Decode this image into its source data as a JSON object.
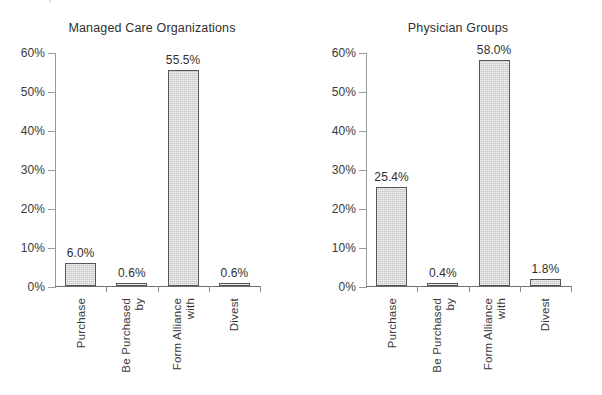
{
  "document": {
    "cropped_header_text": "What Hospitals Should Do in the Year Ahead"
  },
  "chart_data": [
    {
      "type": "bar",
      "title": "Managed Care Organizations",
      "categories": [
        "Purchase",
        "Be Purchased by",
        "Form Alliance with",
        "Divest"
      ],
      "category_lines": [
        [
          "Purchase"
        ],
        [
          "Be Purchased",
          "by"
        ],
        [
          "Form Alliance",
          "with"
        ],
        [
          "Divest"
        ]
      ],
      "values": [
        6.0,
        0.6,
        55.5,
        0.6
      ],
      "value_labels": [
        "6.0%",
        "0.6%",
        "55.5%",
        "0.6%"
      ],
      "xlabel": "",
      "ylabel": "",
      "ylim": [
        0,
        60
      ],
      "ytick_values": [
        0,
        10,
        20,
        30,
        40,
        50,
        60
      ],
      "ytick_labels": [
        "0%",
        "10%",
        "20%",
        "30%",
        "40%",
        "50%",
        "60%"
      ],
      "grid": false,
      "legend": false,
      "bar_fill_color": "#c4c4c4",
      "bar_border_color": "#555555"
    },
    {
      "type": "bar",
      "title": "Physician Groups",
      "categories": [
        "Purchase",
        "Be Purchased by",
        "Form Alliance with",
        "Divest"
      ],
      "category_lines": [
        [
          "Purchase"
        ],
        [
          "Be Purchased",
          "by"
        ],
        [
          "Form Alliance",
          "with"
        ],
        [
          "Divest"
        ]
      ],
      "values": [
        25.4,
        0.4,
        58.0,
        1.8
      ],
      "value_labels": [
        "25.4%",
        "0.4%",
        "58.0%",
        "1.8%"
      ],
      "xlabel": "",
      "ylabel": "",
      "ylim": [
        0,
        60
      ],
      "ytick_values": [
        0,
        10,
        20,
        30,
        40,
        50,
        60
      ],
      "ytick_labels": [
        "0%",
        "10%",
        "20%",
        "30%",
        "40%",
        "50%",
        "60%"
      ],
      "grid": false,
      "legend": false,
      "bar_fill_color": "#c4c4c4",
      "bar_border_color": "#555555"
    }
  ]
}
